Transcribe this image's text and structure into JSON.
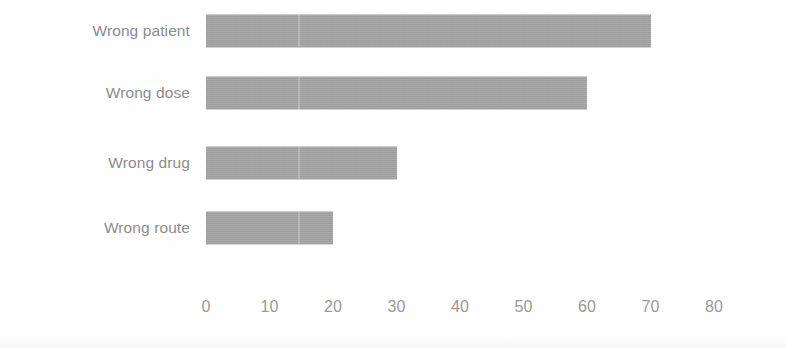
{
  "chart_data": {
    "type": "bar",
    "orientation": "horizontal",
    "title": "",
    "subtitle": "",
    "xlabel": "",
    "ylabel": "",
    "categories": [
      "Wrong patient",
      "Wrong dose",
      "Wrong drug",
      "Wrong route"
    ],
    "values": [
      70,
      60,
      30,
      20
    ],
    "series": [
      {
        "name": "",
        "values": [
          70,
          60,
          30,
          20
        ]
      }
    ],
    "xticks": [
      0,
      10,
      20,
      30,
      40,
      50,
      60,
      70,
      80
    ],
    "xtick_labels": [
      "0",
      "10",
      "20",
      "30",
      "40",
      "50",
      "60",
      "70",
      "80"
    ],
    "xlim": [
      0,
      80
    ],
    "grid": false,
    "legend": false,
    "legend_position": "none",
    "bar_color": "#a5a5a5",
    "label_color": "#8c8c8c",
    "tick_color": "#9a9a9a",
    "background_color": "#fefefe",
    "annotations": []
  },
  "bars": [
    {
      "label": "Wrong patient",
      "value": 70
    },
    {
      "label": "Wrong dose",
      "value": 60
    },
    {
      "label": "Wrong drug",
      "value": 30
    },
    {
      "label": "Wrong route",
      "value": 20
    }
  ],
  "axis": {
    "ticks": [
      "0",
      "10",
      "20",
      "30",
      "40",
      "50",
      "60",
      "70",
      "80"
    ]
  }
}
